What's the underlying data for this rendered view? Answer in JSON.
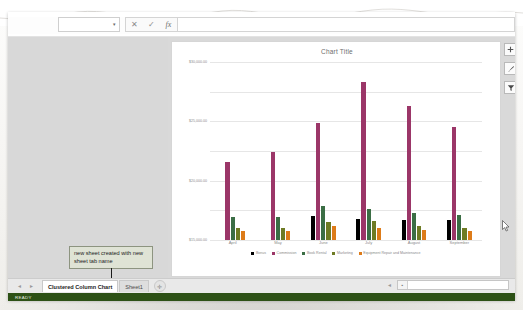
{
  "formula_bar": {
    "name_box_value": "",
    "name_box_caret": "▾",
    "cancel_icon": "✕",
    "enter_icon": "✓",
    "function_icon": "fx",
    "formula_value": ""
  },
  "chart": {
    "title": "Chart Title",
    "buttons": [
      {
        "name": "chart-elements",
        "glyph": "✚"
      },
      {
        "name": "chart-styles",
        "glyph": "✎"
      },
      {
        "name": "chart-filters",
        "glyph": "▼"
      }
    ]
  },
  "chart_data": {
    "type": "bar",
    "title": "Chart Title",
    "xlabel": "",
    "ylabel": "",
    "ylim": [
      0,
      30000
    ],
    "grid": true,
    "legend_position": "bottom",
    "categories": [
      "April",
      "May",
      "June",
      "July",
      "August",
      "September"
    ],
    "tick_labels": [
      "$30,000.00",
      "$25,000.00",
      "$20,000.00",
      "$15,000.00",
      "$10,000.00",
      "$5,000.00",
      "$0.00"
    ],
    "series": [
      {
        "name": "Bonus",
        "color": "#000000",
        "values": [
          0,
          0,
          4000,
          3600,
          3300,
          3300
        ]
      },
      {
        "name": "Commission",
        "color": "#9B3668",
        "values": [
          13200,
          14800,
          19800,
          26700,
          22600,
          19000
        ]
      },
      {
        "name": "Book Rental",
        "color": "#3B6E45",
        "values": [
          3800,
          3900,
          5700,
          5300,
          4600,
          4300
        ]
      },
      {
        "name": "Marketing",
        "color": "#6E7B24",
        "values": [
          2100,
          2000,
          3100,
          3200,
          2400,
          2100
        ]
      },
      {
        "name": "Equipment Repair and Maintenance",
        "color": "#DD7B19",
        "values": [
          1500,
          1500,
          2400,
          2100,
          1700,
          1500
        ]
      }
    ]
  },
  "callout": {
    "text": "new sheet created with new sheet tab name"
  },
  "tab_bar": {
    "nav_arrows": [
      "◄",
      "►"
    ],
    "tabs": [
      {
        "label": "Clustered Column Chart",
        "active": true
      },
      {
        "label": "Sheet1",
        "active": false
      }
    ],
    "new_sheet_glyph": "✛"
  },
  "scrollbar": {
    "left_arrow": "◄",
    "thumb_arrow": "▪"
  },
  "status_bar": {
    "text": "READY"
  }
}
